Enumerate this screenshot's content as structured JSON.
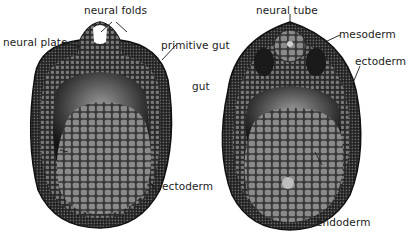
{
  "diagram": {
    "type": "embryo cross-sections",
    "left_section": {
      "labels": {
        "neural_folds": "neural folds",
        "neural_plate": "neural plate",
        "primitive_gut": "primitive gut",
        "ectoderm": "ectoderm"
      }
    },
    "right_section": {
      "labels": {
        "neural_tube": "neural tube",
        "mesoderm": "mesoderm",
        "ectoderm": "ectoderm",
        "gut": "gut",
        "endoderm": "endoderm"
      }
    },
    "colors": {
      "background": "#ffffff",
      "outer_layer": "#2a2a2a",
      "cell_texture": "#6e6e6e",
      "yolk": "#7a7a7a",
      "cavity": "#3a3a3a",
      "label_text": "#1a1a1a"
    }
  }
}
